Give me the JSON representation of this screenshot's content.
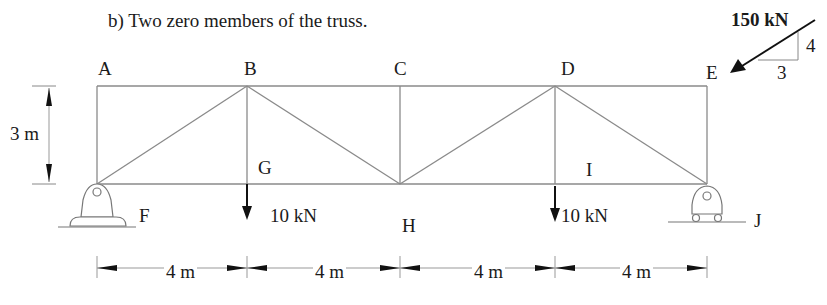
{
  "question": {
    "title": "b)  Two zero members of the truss."
  },
  "nodes": {
    "A": "A",
    "B": "B",
    "C": "C",
    "D": "D",
    "E": "E",
    "F": "F",
    "G": "G",
    "H": "H",
    "I": "I",
    "J": "J"
  },
  "loads": {
    "inclined_load": "150 kN",
    "slope_vertical": "4",
    "slope_horizontal": "3",
    "load_g": "10 kN",
    "load_i": "10 kN"
  },
  "dimensions": {
    "height": "3 m",
    "spans": [
      "4 m",
      "4 m",
      "4 m",
      "4 m"
    ]
  },
  "colors": {
    "member": "#8a8a8a",
    "ink": "#1a1a1a"
  }
}
